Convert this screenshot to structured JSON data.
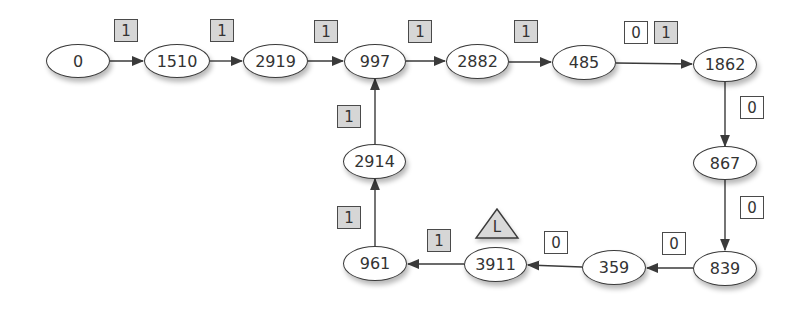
{
  "diagram": {
    "colors": {
      "stroke": "#3a3a3a",
      "node_fill": "#ffffff",
      "badge_one_fill": "#d6d6d6",
      "badge_zero_fill": "#ffffff",
      "marker_fill": "#d9d9d9"
    },
    "nodes": [
      {
        "id": "n0",
        "label": "0"
      },
      {
        "id": "n1510",
        "label": "1510"
      },
      {
        "id": "n2919",
        "label": "2919"
      },
      {
        "id": "n997",
        "label": "997"
      },
      {
        "id": "n2882",
        "label": "2882"
      },
      {
        "id": "n485",
        "label": "485"
      },
      {
        "id": "n1862",
        "label": "1862"
      },
      {
        "id": "n867",
        "label": "867"
      },
      {
        "id": "n839",
        "label": "839"
      },
      {
        "id": "n359",
        "label": "359"
      },
      {
        "id": "n3911",
        "label": "3911"
      },
      {
        "id": "n961",
        "label": "961"
      },
      {
        "id": "n2914",
        "label": "2914"
      }
    ],
    "edges": [
      {
        "from": "0",
        "to": "1510",
        "bits": [
          "1"
        ]
      },
      {
        "from": "1510",
        "to": "2919",
        "bits": [
          "1"
        ]
      },
      {
        "from": "2919",
        "to": "997",
        "bits": [
          "1"
        ]
      },
      {
        "from": "997",
        "to": "2882",
        "bits": [
          "1"
        ]
      },
      {
        "from": "2882",
        "to": "485",
        "bits": [
          "1"
        ]
      },
      {
        "from": "485",
        "to": "1862",
        "bits": [
          "0",
          "1"
        ]
      },
      {
        "from": "1862",
        "to": "867",
        "bits": [
          "0"
        ]
      },
      {
        "from": "867",
        "to": "839",
        "bits": [
          "0"
        ]
      },
      {
        "from": "839",
        "to": "359",
        "bits": [
          "0"
        ]
      },
      {
        "from": "359",
        "to": "3911",
        "bits": [
          "0"
        ]
      },
      {
        "from": "3911",
        "to": "961",
        "bits": [
          "1"
        ]
      },
      {
        "from": "961",
        "to": "2914",
        "bits": [
          "1"
        ]
      },
      {
        "from": "2914",
        "to": "997",
        "bits": [
          "1"
        ]
      }
    ],
    "marker": {
      "on_node": "3911",
      "label": "L",
      "shape": "triangle"
    }
  }
}
